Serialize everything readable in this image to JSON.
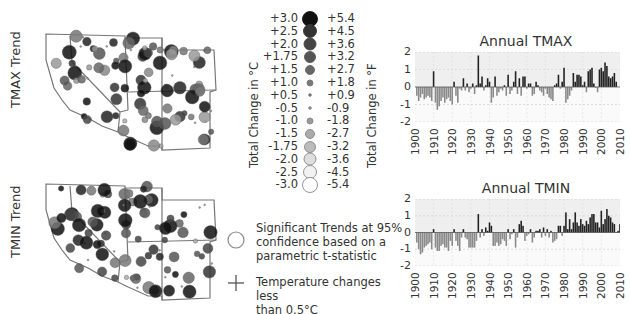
{
  "maps": {
    "tmax": {
      "label": "TMAX Trend"
    },
    "tmin": {
      "label": "TMIN Trend"
    }
  },
  "legend": {
    "celsius_axis_label": "Total Change in °C",
    "fahrenheit_axis_label": "Total Change in °F",
    "rows": [
      {
        "c": "+3.0",
        "f": "+5.4",
        "r": 7.5,
        "fill": "#111111",
        "stroke": "#111111"
      },
      {
        "c": "+2.5",
        "f": "+4.5",
        "r": 6.5,
        "fill": "#333333",
        "stroke": "#333333"
      },
      {
        "c": "+2.0",
        "f": "+3.6",
        "r": 6,
        "fill": "#444444",
        "stroke": "#444444"
      },
      {
        "c": "+1.75",
        "f": "+3.2",
        "r": 5.5,
        "fill": "#555555",
        "stroke": "#555555"
      },
      {
        "c": "+1.5",
        "f": "+2.7",
        "r": 4.5,
        "fill": "#666666",
        "stroke": "#666666"
      },
      {
        "c": "+1.0",
        "f": "+1.8",
        "r": 3,
        "fill": "#777777",
        "stroke": "#777777"
      },
      {
        "c": "+0.5",
        "f": "+0.9",
        "r": 1.3,
        "fill": "#777777",
        "stroke": "#777777"
      },
      {
        "c": "-0.5",
        "f": "-0.9",
        "r": 1.3,
        "fill": "#888888",
        "stroke": "#888888"
      },
      {
        "c": "-1.0",
        "f": "-1.8",
        "r": 3,
        "fill": "#999999",
        "stroke": "#888888"
      },
      {
        "c": "-1.5",
        "f": "-2.7",
        "r": 4.5,
        "fill": "#aaaaaa",
        "stroke": "#888888"
      },
      {
        "c": "-1.75",
        "f": "-3.2",
        "r": 5.5,
        "fill": "#bbbbbb",
        "stroke": "#888888"
      },
      {
        "c": "-2.0",
        "f": "-3.6",
        "r": 6,
        "fill": "#dddddd",
        "stroke": "#888888"
      },
      {
        "c": "-2.5",
        "f": "-4.5",
        "r": 6.5,
        "fill": "#f2f2f2",
        "stroke": "#888888"
      },
      {
        "c": "-3.0",
        "f": "-5.4",
        "r": 7.5,
        "fill": "#ffffff",
        "stroke": "#888888"
      }
    ]
  },
  "notes": {
    "significant": "Significant Trends at 95% confidence based on a parametric t-statistic",
    "significant_lines": [
      "Significant Trends at 95%",
      "confidence based on a",
      "parametric t-statistic"
    ],
    "small_change": "Temperature changes less than 0.5°C",
    "small_change_lines": [
      "Temperature changes less",
      "than 0.5°C"
    ]
  },
  "colors": {
    "positive_bar": "#222222",
    "negative_bar": "#8a8a8a",
    "chart_band_light": "#efefef",
    "chart_band_white": "#ffffff",
    "map_outline": "#777777"
  },
  "chart_data": [
    {
      "type": "bar",
      "title": "Annual TMAX",
      "xlabel": "",
      "ylabel": "",
      "ylim": [
        -2,
        2
      ],
      "yticks": [
        "2",
        "1",
        "0",
        "-1",
        "-2"
      ],
      "xticks": [
        "1900",
        "1910",
        "1920",
        "1930",
        "1940",
        "1950",
        "1960",
        "1970",
        "1980",
        "1990",
        "2000",
        "2010"
      ],
      "grid": true,
      "x": [
        1901,
        1902,
        1903,
        1904,
        1905,
        1906,
        1907,
        1908,
        1909,
        1910,
        1911,
        1912,
        1913,
        1914,
        1915,
        1916,
        1917,
        1918,
        1919,
        1920,
        1921,
        1922,
        1923,
        1924,
        1925,
        1926,
        1927,
        1928,
        1929,
        1930,
        1931,
        1932,
        1933,
        1934,
        1935,
        1936,
        1937,
        1938,
        1939,
        1940,
        1941,
        1942,
        1943,
        1944,
        1945,
        1946,
        1947,
        1948,
        1949,
        1950,
        1951,
        1952,
        1953,
        1954,
        1955,
        1956,
        1957,
        1958,
        1959,
        1960,
        1961,
        1962,
        1963,
        1964,
        1965,
        1966,
        1967,
        1968,
        1969,
        1970,
        1971,
        1972,
        1973,
        1974,
        1975,
        1976,
        1977,
        1978,
        1979,
        1980,
        1981,
        1982,
        1983,
        1984,
        1985,
        1986,
        1987,
        1988,
        1989,
        1990,
        1991,
        1992,
        1993,
        1994,
        1995,
        1996,
        1997,
        1998,
        1999,
        2000,
        2001,
        2002,
        2003,
        2004,
        2005,
        2006,
        2007,
        2008
      ],
      "values": [
        -0.5,
        -0.8,
        -0.6,
        -0.4,
        -0.7,
        -0.6,
        -0.5,
        -0.6,
        -0.8,
        0.9,
        -0.9,
        -1.3,
        -1.1,
        -0.8,
        -0.6,
        -0.9,
        -0.7,
        -0.6,
        -0.8,
        -1.0,
        0.3,
        -0.5,
        -0.9,
        -0.1,
        -0.2,
        0.5,
        -0.2,
        0.2,
        -0.3,
        -0.1,
        0.2,
        -0.4,
        0.1,
        1.8,
        0.2,
        0.6,
        -0.2,
        0.1,
        0.5,
        0.3,
        -0.9,
        -0.6,
        0.6,
        -0.5,
        -0.3,
        -0.1,
        -0.2,
        0.1,
        -0.5,
        0.7,
        -0.4,
        -0.2,
        0.3,
        0.9,
        -0.4,
        0.5,
        -0.5,
        0.6,
        0.6,
        -0.1,
        0.2,
        0.2,
        -0.5,
        -0.4,
        0.3,
        0.1,
        -0.2,
        -0.3,
        -0.5,
        -0.1,
        -0.4,
        -0.6,
        -0.7,
        -0.8,
        0.1,
        0.2,
        0.7,
        -0.1,
        0.3,
        1.1,
        -0.9,
        -0.7,
        -0.5,
        -0.2,
        0.8,
        0.3,
        0.7,
        0.7,
        0.6,
        0.1,
        0.3,
        -0.3,
        0.9,
        1.0,
        1.1,
        0.2,
        0.0,
        -0.3,
        1.0,
        1.1,
        0.9,
        1.4,
        1.2,
        0.6,
        0.5,
        0.6,
        0.8,
        0.3
      ],
      "series": [
        {
          "name": "TMAX anomaly (°C)"
        }
      ]
    },
    {
      "type": "bar",
      "title": "Annual TMIN",
      "xlabel": "",
      "ylabel": "",
      "ylim": [
        -2,
        2
      ],
      "yticks": [
        "2",
        "1",
        "0",
        "-1",
        "-2"
      ],
      "xticks": [
        "1900",
        "1910",
        "1920",
        "1930",
        "1940",
        "1950",
        "1960",
        "1970",
        "1980",
        "1990",
        "2000",
        "2010"
      ],
      "grid": true,
      "x": [
        1901,
        1902,
        1903,
        1904,
        1905,
        1906,
        1907,
        1908,
        1909,
        1910,
        1911,
        1912,
        1913,
        1914,
        1915,
        1916,
        1917,
        1918,
        1919,
        1920,
        1921,
        1922,
        1923,
        1924,
        1925,
        1926,
        1927,
        1928,
        1929,
        1930,
        1931,
        1932,
        1933,
        1934,
        1935,
        1936,
        1937,
        1938,
        1939,
        1940,
        1941,
        1942,
        1943,
        1944,
        1945,
        1946,
        1947,
        1948,
        1949,
        1950,
        1951,
        1952,
        1953,
        1954,
        1955,
        1956,
        1957,
        1958,
        1959,
        1960,
        1961,
        1962,
        1963,
        1964,
        1965,
        1966,
        1967,
        1968,
        1969,
        1970,
        1971,
        1972,
        1973,
        1974,
        1975,
        1976,
        1977,
        1978,
        1979,
        1980,
        1981,
        1982,
        1983,
        1984,
        1985,
        1986,
        1987,
        1988,
        1989,
        1990,
        1991,
        1992,
        1993,
        1994,
        1995,
        1996,
        1997,
        1998,
        1999,
        2000,
        2001,
        2002,
        2003,
        2004,
        2005,
        2006,
        2007,
        2008,
        2009,
        2010
      ],
      "values": [
        -0.6,
        -1.0,
        -1.3,
        -1.2,
        -0.9,
        -0.8,
        -0.7,
        -0.6,
        -1.0,
        0.2,
        -0.9,
        -1.1,
        -1.1,
        -0.8,
        -0.7,
        -0.9,
        -0.9,
        -1.1,
        -0.5,
        -0.8,
        0.2,
        -0.5,
        -0.8,
        -1.1,
        -0.3,
        0.2,
        -0.3,
        -0.4,
        -0.9,
        -0.9,
        -0.9,
        -0.9,
        -0.5,
        1.1,
        -0.3,
        0.2,
        -0.2,
        0.3,
        0.1,
        0.6,
        0.4,
        -0.8,
        -0.8,
        -0.6,
        -0.8,
        -0.7,
        -0.4,
        -0.5,
        -0.8,
        0.2,
        -0.4,
        -0.1,
        0.2,
        -0.9,
        -0.3,
        0.5,
        0.7,
        0.4,
        -0.5,
        -0.2,
        -0.1,
        0.2,
        -0.6,
        -0.3,
        0.1,
        0.1,
        0.2,
        -0.3,
        0.3,
        -0.2,
        0.2,
        -0.3,
        0.1,
        -0.6,
        -0.5,
        -0.4,
        0.4,
        0.4,
        -0.2,
        0.4,
        1.2,
        0.2,
        0.8,
        0.2,
        0.6,
        1.2,
        0.6,
        0.4,
        0.8,
        0.5,
        0.4,
        0.7,
        0.5,
        0.9,
        1.1,
        1.1,
        0.6,
        0.6,
        0.3,
        1.3,
        0.5,
        0.8,
        1.4,
        1.0,
        0.9,
        0.6,
        0.5,
        0.0,
        0.1,
        0.5
      ],
      "series": [
        {
          "name": "TMIN anomaly (°C)"
        }
      ]
    }
  ]
}
